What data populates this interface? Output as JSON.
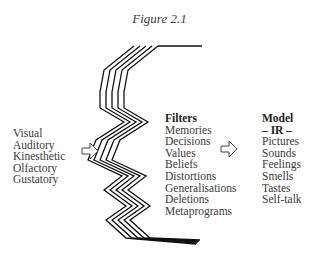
{
  "figure": {
    "title": "Figure 2.1"
  },
  "senses": {
    "items": [
      "Visual",
      "Auditory",
      "Kinesthetic",
      "Olfactory",
      "Gustatory"
    ]
  },
  "filters": {
    "heading": "Filters",
    "items": [
      "Memories",
      "Decisions",
      "Values",
      "Beliefs",
      "Distortions",
      "Generalisations",
      "Deletions",
      "Metaprograms"
    ]
  },
  "model": {
    "heading": "Model",
    "subheading": "– IR –",
    "items": [
      "Pictures",
      "Sounds",
      "Feelings",
      "Smells",
      "Tastes",
      "Self-talk"
    ]
  },
  "arrows": [
    {
      "name": "senses-to-filters",
      "direction": "right"
    },
    {
      "name": "filters-to-model",
      "direction": "right"
    }
  ],
  "colors": {
    "text": "#3a3a3a",
    "lines": "#111111",
    "background": "#ffffff"
  }
}
